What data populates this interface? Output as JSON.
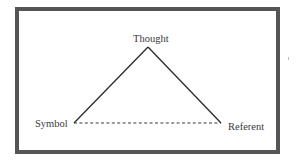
{
  "diagram": {
    "type": "semiotic-triangle",
    "nodes": {
      "apex": {
        "label": "Thought",
        "x": 148,
        "y": 47
      },
      "left": {
        "label": "Symbol",
        "x": 74,
        "y": 123
      },
      "right": {
        "label": "Referent",
        "x": 221,
        "y": 123
      }
    },
    "edges": [
      {
        "from": "left",
        "to": "apex",
        "style": "solid"
      },
      {
        "from": "apex",
        "to": "right",
        "style": "solid"
      },
      {
        "from": "left",
        "to": "right",
        "style": "dashed"
      }
    ],
    "colors": {
      "frame": "#555555",
      "line": "#2a2a2a",
      "text": "#3a3a3a",
      "background": "#ffffff"
    }
  }
}
